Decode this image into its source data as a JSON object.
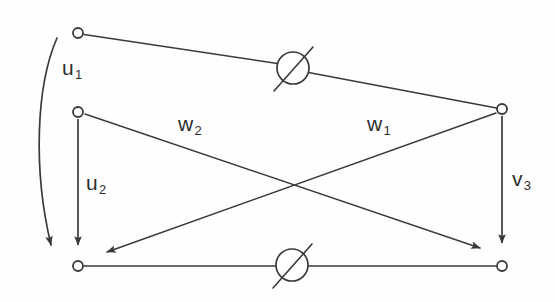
{
  "figure": {
    "type": "circuit-signal-flow-diagram",
    "background_color": "#fefefe",
    "stroke_color": "#3a3a3a",
    "label_color": "#2e2e2e"
  },
  "labels": {
    "u1": {
      "base": "u",
      "sub": "1",
      "text": "u1"
    },
    "u2": {
      "base": "u",
      "sub": "2",
      "text": "u2"
    },
    "w1": {
      "base": "w",
      "sub": "1",
      "text": "w1"
    },
    "w2": {
      "base": "w",
      "sub": "2",
      "text": "w2"
    },
    "v3": {
      "base": "v",
      "sub": "3",
      "text": "v3"
    }
  },
  "nodes": [
    {
      "name": "node-top-left",
      "x": 78,
      "y": 33,
      "r": 5
    },
    {
      "name": "node-mid-left",
      "x": 78,
      "y": 112,
      "r": 5
    },
    {
      "name": "node-right-upper",
      "x": 502,
      "y": 109,
      "r": 5
    },
    {
      "name": "node-bottom-left",
      "x": 78,
      "y": 266,
      "r": 5
    },
    {
      "name": "node-bottom-right",
      "x": 502,
      "y": 266,
      "r": 5
    }
  ],
  "elements": [
    {
      "name": "source-symbol-top",
      "cx": 293,
      "cy": 68,
      "r": 16,
      "symbol": "crossed-circle"
    },
    {
      "name": "source-symbol-bottom",
      "cx": 292,
      "cy": 265,
      "r": 16,
      "symbol": "crossed-circle"
    }
  ],
  "edges": [
    {
      "name": "branch-top",
      "from": "node-top-left",
      "to": "node-right-upper",
      "arrow": false
    },
    {
      "name": "branch-bottom",
      "from": "node-bottom-left",
      "to": "node-bottom-right",
      "arrow": false
    },
    {
      "name": "arrow-u1",
      "label": "u1",
      "arrow": true,
      "shape": "curved"
    },
    {
      "name": "arrow-u2",
      "label": "u2",
      "from": "node-mid-left",
      "to": "node-bottom-left",
      "arrow": true
    },
    {
      "name": "arrow-v3",
      "label": "v3",
      "from": "node-right-upper",
      "to": "node-bottom-right",
      "arrow": true
    },
    {
      "name": "arrow-w2",
      "label": "w2",
      "from": "node-mid-left",
      "to": "node-bottom-right",
      "arrow": true
    },
    {
      "name": "arrow-w1",
      "label": "w1",
      "from": "node-right-upper",
      "to": "node-bottom-left",
      "arrow": true
    }
  ]
}
